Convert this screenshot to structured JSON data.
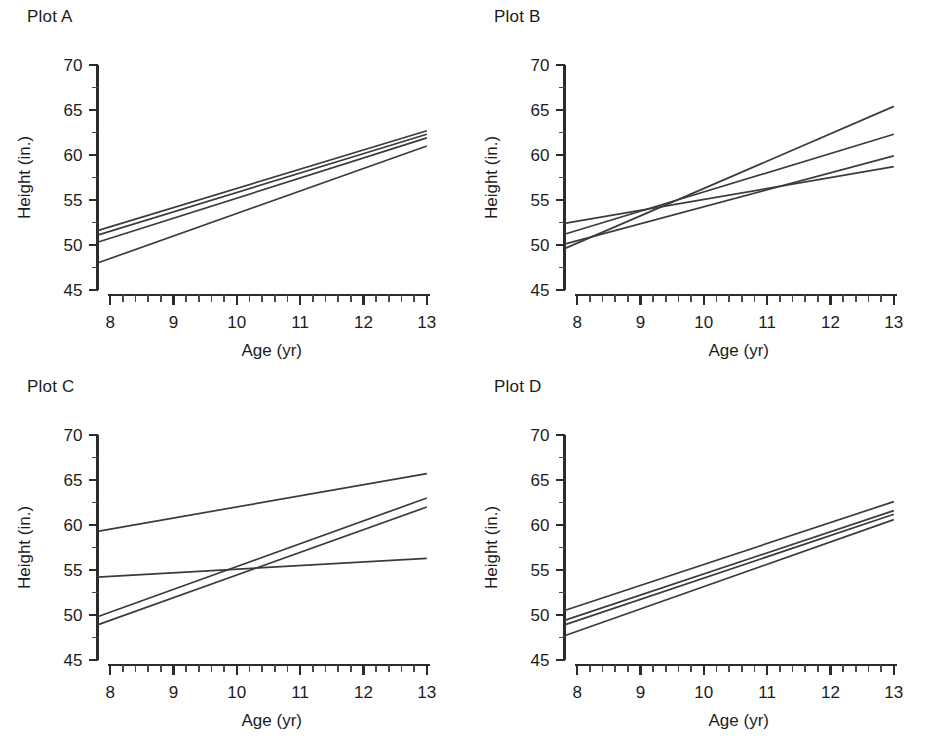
{
  "figure": {
    "background": "#ffffff",
    "line_color": "#3b3b3b",
    "axis_color": "#2b2b2b",
    "text_color": "#1c1c1c"
  },
  "axes": {
    "x_title": "Age (yr)",
    "y_title": "Height (in.)",
    "x_ticks": [
      "8",
      "9",
      "10",
      "11",
      "12",
      "13"
    ],
    "y_ticks": [
      "45",
      "50",
      "55",
      "60",
      "65",
      "70"
    ],
    "x_range": [
      7.8,
      13.05
    ],
    "y_range": [
      45,
      70
    ],
    "x_minor_per_major": 5,
    "y_minor_per_major": 2,
    "grid": false,
    "legend": "none"
  },
  "panels": [
    {
      "id": "A",
      "title": "Plot A"
    },
    {
      "id": "B",
      "title": "Plot B"
    },
    {
      "id": "C",
      "title": "Plot C"
    },
    {
      "id": "D",
      "title": "Plot D"
    }
  ],
  "chart_data": [
    {
      "type": "line",
      "title": "Plot A",
      "xlabel": "Age (yr)",
      "ylabel": "Height (in.)",
      "xlim": [
        7.8,
        13.05
      ],
      "ylim": [
        45,
        70
      ],
      "x": [
        7.8,
        13.0
      ],
      "grid": false,
      "legend": "none",
      "series": [
        {
          "name": "line-1",
          "values": [
            51.6,
            62.7
          ]
        },
        {
          "name": "line-2",
          "values": [
            51.1,
            62.3
          ]
        },
        {
          "name": "line-3",
          "values": [
            50.3,
            61.9
          ]
        },
        {
          "name": "line-4",
          "values": [
            48.0,
            61.0
          ]
        }
      ]
    },
    {
      "type": "line",
      "title": "Plot B",
      "xlabel": "Age (yr)",
      "ylabel": "Height (in.)",
      "xlim": [
        7.8,
        13.05
      ],
      "ylim": [
        45,
        70
      ],
      "x": [
        7.8,
        13.0
      ],
      "grid": false,
      "legend": "none",
      "series": [
        {
          "name": "line-1",
          "values": [
            49.6,
            65.4
          ]
        },
        {
          "name": "line-2",
          "values": [
            51.2,
            62.3
          ]
        },
        {
          "name": "line-3",
          "values": [
            50.1,
            59.9
          ]
        },
        {
          "name": "line-4",
          "values": [
            52.4,
            58.7
          ]
        }
      ]
    },
    {
      "type": "line",
      "title": "Plot C",
      "xlabel": "Age (yr)",
      "ylabel": "Height (in.)",
      "xlim": [
        7.8,
        13.05
      ],
      "ylim": [
        45,
        70
      ],
      "x": [
        7.8,
        13.0
      ],
      "grid": false,
      "legend": "none",
      "series": [
        {
          "name": "line-1",
          "values": [
            59.3,
            65.7
          ]
        },
        {
          "name": "line-2",
          "values": [
            49.8,
            63.0
          ]
        },
        {
          "name": "line-3",
          "values": [
            48.9,
            62.0
          ]
        },
        {
          "name": "line-4",
          "values": [
            54.2,
            56.3
          ]
        }
      ]
    },
    {
      "type": "line",
      "title": "Plot D",
      "xlabel": "Age (yr)",
      "ylabel": "Height (in.)",
      "xlim": [
        7.8,
        13.05
      ],
      "ylim": [
        45,
        70
      ],
      "x": [
        7.8,
        13.0
      ],
      "grid": false,
      "legend": "none",
      "series": [
        {
          "name": "line-1",
          "values": [
            50.5,
            62.6
          ]
        },
        {
          "name": "line-2",
          "values": [
            49.4,
            61.6
          ]
        },
        {
          "name": "line-3",
          "values": [
            48.9,
            61.2
          ]
        },
        {
          "name": "line-4",
          "values": [
            47.7,
            60.6
          ]
        }
      ]
    }
  ]
}
